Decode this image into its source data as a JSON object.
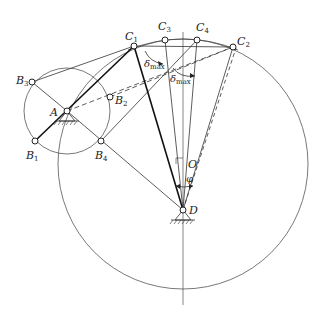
{
  "figure": {
    "background": "#ffffff",
    "stroke_color": "#222222"
  },
  "points": {
    "A": {
      "label": "A",
      "x": 67,
      "y": 111
    },
    "B1": {
      "label": "B",
      "sub": "1",
      "x": 35,
      "y": 141
    },
    "B2": {
      "label": "B",
      "sub": "2",
      "x": 110,
      "y": 97
    },
    "B3": {
      "label": "B",
      "sub": "3",
      "x": 32,
      "y": 82
    },
    "B4": {
      "label": "B",
      "sub": "4",
      "x": 101,
      "y": 141
    },
    "C1": {
      "label": "C",
      "sub": "1",
      "x": 134,
      "y": 46
    },
    "C2": {
      "label": "C",
      "sub": "2",
      "x": 233,
      "y": 47
    },
    "C3": {
      "label": "C",
      "sub": "3",
      "x": 165,
      "y": 40
    },
    "C4": {
      "label": "C",
      "sub": "4",
      "x": 197,
      "y": 40
    },
    "O": {
      "label": "O",
      "x": 183,
      "y": 164
    },
    "D": {
      "label": "D",
      "x": 183,
      "y": 210
    }
  },
  "angles": {
    "delta_max_1": {
      "symbol": "δ",
      "sub": "max"
    },
    "delta_max_2": {
      "symbol": "δ",
      "sub": "max"
    },
    "phi": {
      "symbol": "φ"
    }
  },
  "circles": {
    "crank_circle": {
      "cx": 67,
      "cy": 111,
      "r": 43
    },
    "large_circle": {
      "cx": 183,
      "cy": 164,
      "r": 125
    }
  }
}
